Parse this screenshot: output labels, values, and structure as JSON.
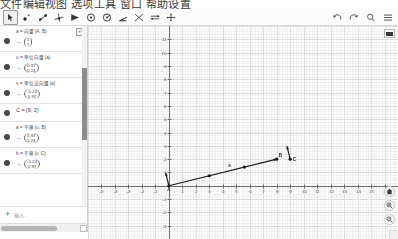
{
  "page": {
    "cut_off_header": "文件编辑视图 选项工具 窗口 帮助设置"
  },
  "toolbar": {
    "tools": [
      {
        "name": "move-tool",
        "label": "移动",
        "selected": true
      },
      {
        "name": "point-tool",
        "label": "点",
        "selected": false
      },
      {
        "name": "line-tool",
        "label": "直线",
        "selected": false
      },
      {
        "name": "perpendicular-line-tool",
        "label": "垂线",
        "selected": false
      },
      {
        "name": "polygon-tool",
        "label": "多边形",
        "selected": false
      },
      {
        "name": "circle-tool",
        "label": "圆",
        "selected": false
      },
      {
        "name": "ellipse-tool",
        "label": "圆锥曲线",
        "selected": false
      },
      {
        "name": "angle-tool",
        "label": "角度",
        "selected": false
      },
      {
        "name": "reflect-tool",
        "label": "变换",
        "selected": false
      },
      {
        "name": "slider-tool",
        "label": "滑动条",
        "selected": false
      },
      {
        "name": "move-graphics-tool",
        "label": "移动绘图区",
        "selected": false
      }
    ],
    "right_tools": [
      {
        "name": "undo-button",
        "label": "撤销"
      },
      {
        "name": "redo-button",
        "label": "重做"
      },
      {
        "name": "search-button",
        "label": "搜索"
      },
      {
        "name": "menu-button",
        "label": "主菜单"
      }
    ]
  },
  "algebra": {
    "rows": [
      {
        "definition": "a = 向量(A, B)",
        "badge": "≡∇",
        "value_type": "vector",
        "value": [
          "1",
          "1"
        ],
        "dot": true
      },
      {
        "definition": "u = 单位向量(a)",
        "badge": "",
        "value_type": "vector",
        "value": [
          "0.97",
          "0.24"
        ],
        "dot": true
      },
      {
        "definition": "v = 单位法向量(a)",
        "badge": "",
        "value_type": "vector",
        "value": [
          "-0.24",
          "0.97"
        ],
        "dot": true
      },
      {
        "definition": "C = (9, 2)",
        "badge": "",
        "value_type": "point",
        "value": "",
        "dot": true
      },
      {
        "definition": "a = 平移(u, B)",
        "badge": "",
        "value_type": "vector",
        "value": [
          "0.97",
          "0.24"
        ],
        "dot": true
      },
      {
        "definition": "b = 平移(v, C)",
        "badge": "",
        "value_type": "vector",
        "value": [
          "-0.24",
          "0.97"
        ],
        "dot": true
      }
    ],
    "input_placeholder": "输入…",
    "add_label": "+"
  },
  "graphics": {
    "style_bar_label": "样式栏",
    "home_label": "回到标准视窗",
    "zoom_in_label": "放大",
    "zoom_out_label": "缩小",
    "axes": {
      "x_ticks": [
        -5,
        -4,
        -3,
        -2,
        -1,
        1,
        2,
        3,
        4,
        5,
        6,
        7,
        8,
        9,
        10,
        11,
        12,
        13,
        14,
        15,
        16
      ],
      "y_ticks": [
        -3,
        -2,
        -1,
        1,
        2,
        3,
        4,
        5,
        6,
        7,
        8,
        9,
        10,
        11
      ],
      "x_range": [
        -6,
        17
      ],
      "y_range": [
        -4,
        12
      ]
    },
    "objects": [
      {
        "name": "point-A",
        "label": "A",
        "x": 0,
        "y": 0
      },
      {
        "name": "point-B",
        "label": "B",
        "x": 8,
        "y": 2
      },
      {
        "name": "point-C",
        "label": "C",
        "x": 9,
        "y": 2
      },
      {
        "name": "vector-a",
        "label": "a",
        "from": [
          0,
          0
        ],
        "to": [
          8,
          2
        ]
      },
      {
        "name": "vector-v",
        "label": "v",
        "from": [
          0,
          0
        ],
        "to": [
          -0.24,
          0.97
        ]
      },
      {
        "name": "vector-b",
        "label": "b",
        "from": [
          9,
          2
        ],
        "to": [
          8.76,
          2.97
        ]
      }
    ]
  }
}
